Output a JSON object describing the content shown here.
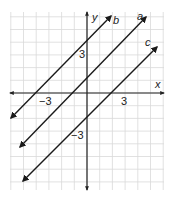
{
  "chart_data": {
    "type": "line",
    "title": "",
    "xlabel": "x",
    "ylabel": "y",
    "xlim": [
      -6,
      6
    ],
    "ylim": [
      -7,
      7
    ],
    "grid": true,
    "tick_labels": {
      "x": [
        {
          "value": -3,
          "label": "−3"
        },
        {
          "value": 3,
          "label": "3"
        }
      ],
      "y": [
        {
          "value": 3,
          "label": "3"
        },
        {
          "value": -3,
          "label": "−3"
        }
      ]
    },
    "series": [
      {
        "name": "b",
        "equation": "y = x + 4",
        "slope": 1,
        "intercept": 4,
        "x": [
          -6,
          2
        ],
        "y": [
          -2,
          6
        ]
      },
      {
        "name": "a",
        "equation": "y = x + 1",
        "slope": 1,
        "intercept": 1,
        "x": [
          -5,
          5
        ],
        "y": [
          -4,
          6
        ]
      },
      {
        "name": "c",
        "equation": "y = x - 2",
        "slope": 1,
        "intercept": -2,
        "x": [
          -5,
          6
        ],
        "y": [
          -7,
          4
        ]
      }
    ],
    "legend": "inline labels at upper-right arrow ends"
  },
  "axes": {
    "x_label": "x",
    "y_label": "y",
    "x_neg_tick": "−3",
    "x_pos_tick": "3",
    "y_pos_tick": "3",
    "y_neg_tick": "−3"
  },
  "lines": {
    "a": "a",
    "b": "b",
    "c": "c"
  },
  "colors": {
    "grid": "#d9d9d9",
    "axis": "#222222",
    "line": "#1a1a1a"
  }
}
